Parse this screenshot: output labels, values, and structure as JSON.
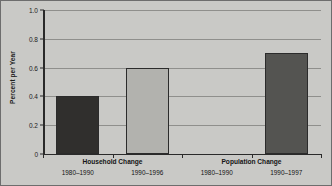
{
  "chart_data": {
    "type": "bar",
    "title": "",
    "xlabel": "",
    "ylabel": "Percent per Year",
    "ylim": [
      0,
      1.0
    ],
    "ytick_labels": [
      "1.0",
      "0.8",
      "0.6",
      "0.4",
      "0.2",
      "0"
    ],
    "ytick_values": [
      1.0,
      0.8,
      0.6,
      0.4,
      0.2,
      0
    ],
    "grid": "horizontal",
    "legend": "none",
    "groups": [
      {
        "name": "Household Change",
        "categories": [
          "1980–1990",
          "1990–1996"
        ]
      },
      {
        "name": "Population Change",
        "categories": [
          "1980–1990",
          "1990–1997"
        ]
      }
    ],
    "categories": [
      "1980–1990",
      "1990–1996",
      "1980–1990",
      "1990–1997"
    ],
    "values": [
      0.4,
      0.6,
      null,
      0.7
    ],
    "bar_colors": [
      "#302f2d",
      "#b2b2ae",
      null,
      "#545451"
    ]
  },
  "axis": {
    "y_title": "Percent per Year",
    "ticks": [
      {
        "label": "1.0",
        "value": 1.0
      },
      {
        "label": "0.8",
        "value": 0.8
      },
      {
        "label": "0.6",
        "value": 0.6
      },
      {
        "label": "0.4",
        "value": 0.4
      },
      {
        "label": "0.2",
        "value": 0.2
      },
      {
        "label": "0",
        "value": 0
      }
    ]
  },
  "groups": [
    {
      "name": "Household Change"
    },
    {
      "name": "Population Change"
    }
  ],
  "periods": [
    {
      "label": "1980–1990"
    },
    {
      "label": "1990–1996"
    },
    {
      "label": "1980–1990"
    },
    {
      "label": "1990–1997"
    }
  ],
  "colors": {
    "background": "#c9c9c6",
    "frame": "#6d6d6d",
    "gridline": "#8f8f8c",
    "axis": "#2a2a2a",
    "bar_dark": "#302f2d",
    "bar_light": "#b2b2ae",
    "bar_medium": "#545451",
    "text": "#141414"
  }
}
